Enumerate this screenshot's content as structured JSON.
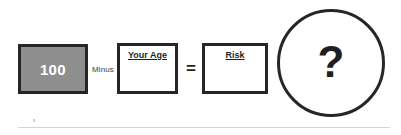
{
  "slide": {
    "type": "formula-diagram",
    "background_color": "#ffffff",
    "formula": {
      "expression": "100 Minus Your Age = Risk",
      "terms": [
        {
          "kind": "constant",
          "label": "100"
        },
        {
          "kind": "operator",
          "label": "Minus"
        },
        {
          "kind": "variable",
          "label": "Your Age"
        },
        {
          "kind": "operator",
          "label": "="
        },
        {
          "kind": "result",
          "label": "Risk"
        }
      ]
    },
    "value_box": {
      "value": "100",
      "fill_color": "#8e8e8e",
      "text_color": "#ffffff",
      "border_color": "#262626"
    },
    "minus_operator": {
      "label": "Minus"
    },
    "your_age_box": {
      "label": "Your Age",
      "value": "",
      "fill_color": "#ffffff",
      "border_color": "#262626"
    },
    "equals_operator": {
      "label": "="
    },
    "risk_box": {
      "label": "Risk",
      "value": "",
      "fill_color": "#ffffff",
      "border_color": "#262626"
    },
    "question_circle": {
      "glyph": "?",
      "icon_name": "question-mark-icon",
      "border_color": "#262626",
      "fill_color": "#ffffff"
    },
    "divider": {
      "color": "#d2d2d2"
    }
  }
}
